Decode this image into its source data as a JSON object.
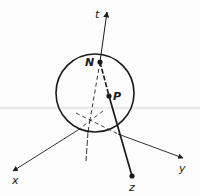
{
  "figure": {
    "type": "3d-coordinate-diagram",
    "labels": {
      "t_axis": "t",
      "x_axis": "x",
      "y_axis": "y",
      "z_point": "z",
      "north_point": "N",
      "point_p": "P"
    },
    "colors": {
      "ink": "#1a1a1a",
      "background": "#fdfdfd"
    },
    "elements": {
      "sphere": {
        "cx": 95,
        "cy": 93,
        "r": 39
      },
      "origin": {
        "x": 90,
        "y": 120
      },
      "N": {
        "x": 100,
        "y": 62
      },
      "P": {
        "x": 109,
        "y": 96
      },
      "z": {
        "x": 132,
        "y": 176
      },
      "t_axis_tip": {
        "x": 107,
        "y": 12
      },
      "x_axis_tip": {
        "x": 13,
        "y": 171
      },
      "y_axis_tip": {
        "x": 183,
        "y": 158
      }
    }
  }
}
